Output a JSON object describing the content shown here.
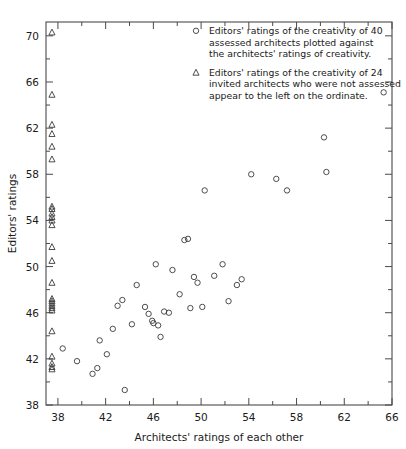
{
  "chart_data": {
    "type": "scatter",
    "title": "",
    "xlabel": "Architects' ratings of each other",
    "ylabel": "Editors' ratings",
    "xlim": [
      37.0,
      66.0
    ],
    "ylim": [
      38.0,
      71.2
    ],
    "grid": false,
    "legend_position": "inside-top-right",
    "xticks": [
      38,
      42,
      46,
      50,
      54,
      58,
      62,
      66
    ],
    "xticklabels": [
      "38",
      "42",
      "46",
      "50",
      "54",
      "58",
      "62",
      "66"
    ],
    "xminorticks": [
      40,
      44,
      48,
      52,
      56,
      60,
      64
    ],
    "yticks": [
      38,
      42,
      46,
      50,
      54,
      58,
      62,
      66,
      70
    ],
    "yticklabels": [
      "38",
      "42",
      "46",
      "50",
      "54",
      "58",
      "62",
      "66",
      "70"
    ],
    "yminorticks": [
      40,
      44,
      48,
      52,
      56,
      60,
      64,
      68
    ],
    "series": [
      {
        "name": "assessed",
        "marker": "circle",
        "count": 40,
        "legend_label": "Editors' ratings of the creativity of 40 assessed architects plotted against the architects' ratings of creativity.",
        "points": [
          [
            38.4,
            42.9
          ],
          [
            39.6,
            41.8
          ],
          [
            40.9,
            40.7
          ],
          [
            41.3,
            41.2
          ],
          [
            41.5,
            43.6
          ],
          [
            42.1,
            42.4
          ],
          [
            42.6,
            44.6
          ],
          [
            43.0,
            46.6
          ],
          [
            43.4,
            47.1
          ],
          [
            43.6,
            39.3
          ],
          [
            44.2,
            45.0
          ],
          [
            44.6,
            48.4
          ],
          [
            45.3,
            46.5
          ],
          [
            45.6,
            45.9
          ],
          [
            45.9,
            45.3
          ],
          [
            46.0,
            45.1
          ],
          [
            46.2,
            50.2
          ],
          [
            46.4,
            44.9
          ],
          [
            46.6,
            43.9
          ],
          [
            46.9,
            46.1
          ],
          [
            47.3,
            46.0
          ],
          [
            47.6,
            49.7
          ],
          [
            48.2,
            47.6
          ],
          [
            48.6,
            52.3
          ],
          [
            48.9,
            52.4
          ],
          [
            49.1,
            46.4
          ],
          [
            49.4,
            49.1
          ],
          [
            49.7,
            48.6
          ],
          [
            50.1,
            46.5
          ],
          [
            50.3,
            56.6
          ],
          [
            51.1,
            49.2
          ],
          [
            51.8,
            50.2
          ],
          [
            52.3,
            47.0
          ],
          [
            53.0,
            48.4
          ],
          [
            53.4,
            48.9
          ],
          [
            54.2,
            58.0
          ],
          [
            56.3,
            57.6
          ],
          [
            57.2,
            56.6
          ],
          [
            60.3,
            61.2
          ],
          [
            60.5,
            58.2
          ],
          [
            65.3,
            65.1
          ]
        ]
      },
      {
        "name": "invited",
        "marker": "triangle",
        "count": 24,
        "legend_label": "Editors' ratings of the creativity of 24 invited architects who were not assessed appear to the left on the ordinate.",
        "x_position": 37.5,
        "values": [
          70.3,
          64.9,
          62.3,
          61.5,
          60.4,
          59.3,
          55.2,
          55.0,
          54.6,
          54.3,
          54.0,
          53.6,
          51.7,
          50.5,
          48.6,
          47.2,
          47.0,
          46.8,
          46.6,
          46.4,
          46.2,
          44.4,
          42.2,
          41.6,
          41.3,
          41.1
        ]
      }
    ]
  }
}
